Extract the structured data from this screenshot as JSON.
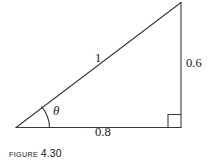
{
  "figure": {
    "caption_word": "FIGURE",
    "caption_number": "4.30",
    "background_color": "#ffffff",
    "line_color": "#3a3a3a",
    "text_color": "#1a1a1a"
  },
  "diagram": {
    "type": "right-triangle",
    "labels": {
      "hypotenuse": "1",
      "opposite_side": "0.6",
      "adjacent_side": "0.8",
      "angle": "θ"
    },
    "vertices": {
      "left": "(16, 127)",
      "bottom_right": "(181, 127)",
      "top": "(181, 2)"
    },
    "markers": {
      "right_angle": "right-angle-square",
      "angle_arc": "theta-arc"
    }
  }
}
